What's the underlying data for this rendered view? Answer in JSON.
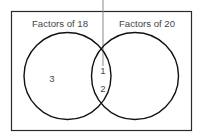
{
  "figure": {
    "type": "venn-diagram",
    "name": "factors-venn-diagram",
    "cut_off_title": "Factors of 18 and 20",
    "background_color": "#ffffff",
    "stroke_color": "#1a1a1a",
    "text_color": "#454545",
    "leader_line_color": "#8a8a8a"
  },
  "frame": {
    "name": "outer-rectangle",
    "x": 11,
    "y": 11,
    "width": 181,
    "height": 120
  },
  "sets": [
    {
      "id": "left",
      "label": "Factors of 18",
      "label_x": 60,
      "label_y": 26,
      "circle": {
        "cx": 67.5,
        "cy": 76,
        "r": 43.5
      }
    },
    {
      "id": "right",
      "label": "Factors of 20",
      "label_x": 147,
      "label_y": 26,
      "circle": {
        "cx": 135,
        "cy": 76,
        "r": 43.5
      }
    }
  ],
  "regions": [
    {
      "id": "left-only",
      "name": "left-only-region",
      "members": [
        "3"
      ],
      "positions": [
        {
          "x": 52,
          "y": 79
        }
      ]
    },
    {
      "id": "intersection",
      "name": "intersection-region",
      "members": [
        "1",
        "2"
      ],
      "positions": [
        {
          "x": 103,
          "y": 71
        },
        {
          "x": 103,
          "y": 89
        }
      ]
    },
    {
      "id": "right-only",
      "name": "right-only-region",
      "members": [],
      "positions": []
    }
  ],
  "leader_line": {
    "name": "pointer-leader-line",
    "x": 103,
    "y1": 0,
    "y2": 66
  }
}
